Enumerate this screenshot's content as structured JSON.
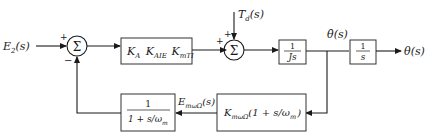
{
  "diagram": {
    "type": "control-system-block-diagram",
    "input": {
      "label": "E",
      "sub": "2",
      "arg": "(s)"
    },
    "output": {
      "label": "θ",
      "arg": "(s)"
    },
    "disturbance": {
      "label": "T",
      "sub": "d",
      "arg": "(s)"
    },
    "sum1": {
      "symbol": "Σ",
      "sign_in": "+",
      "sign_fb": "−"
    },
    "sum2": {
      "symbol": "Σ",
      "sign_in": "+",
      "sign_dist": "+"
    },
    "blocks": {
      "forward_gain": {
        "parts": [
          {
            "b": "K",
            "s": "A"
          },
          {
            "b": "K",
            "s": "AIE"
          },
          {
            "b": "K",
            "s": "mTI"
          }
        ]
      },
      "plant_inertia": {
        "num": "1",
        "den": "Js"
      },
      "integrator": {
        "num": "1",
        "den": "s"
      },
      "tach": {
        "b": "K",
        "s": "mωΩ",
        "rest": "(1 + s/ω",
        "rest_sub": "m",
        "close": ")"
      },
      "filter": {
        "num": "1",
        "den": "1 + s/ω",
        "den_sub": "m"
      }
    },
    "signals": {
      "rate": {
        "label": "θ̇",
        "arg": "(s)"
      },
      "feedback": {
        "label": "E",
        "sub": "mωΩ",
        "arg": "(s)"
      }
    }
  }
}
